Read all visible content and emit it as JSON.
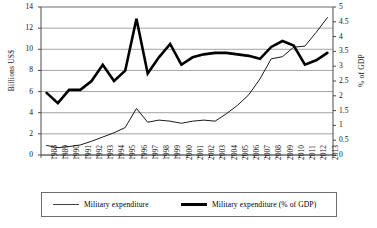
{
  "chart_data": {
    "type": "line",
    "title": "",
    "xlabel": "",
    "ylabel": "Billions US$",
    "y2label": "% of GDP",
    "grid": true,
    "legend_position": "bottom",
    "ylim": [
      0,
      14
    ],
    "y2lim": [
      0,
      5
    ],
    "yticks": [
      "0",
      "2",
      "4",
      "6",
      "8",
      "10",
      "12",
      "14"
    ],
    "ytick_values": [
      0,
      2,
      4,
      6,
      8,
      10,
      12,
      14
    ],
    "y2ticks": [
      "0",
      "0.5",
      "1",
      "1.5",
      "2",
      "2.5",
      "3",
      "3.5",
      "4",
      "4.5",
      "5"
    ],
    "y2tick_values": [
      0,
      0.5,
      1,
      1.5,
      2,
      2.5,
      3,
      3.5,
      4,
      4.5,
      5
    ],
    "categories": [
      "1988",
      "1989",
      "1990",
      "1991",
      "1992",
      "1993",
      "1994",
      "1995",
      "1996",
      "1997",
      "1998",
      "1999",
      "2000",
      "2001",
      "2002",
      "2003",
      "2004",
      "2005",
      "2006",
      "2007",
      "2008",
      "2009",
      "2010",
      "2011",
      "2012",
      "2013"
    ],
    "series": [
      {
        "name": "Military expenditure",
        "axis": "left",
        "unit": "Billions US$",
        "style": "thin",
        "values": [
          0.9,
          0.7,
          0.8,
          0.95,
          1.3,
          1.7,
          2.1,
          2.6,
          4.4,
          3.1,
          3.3,
          3.2,
          3.0,
          3.2,
          3.3,
          3.2,
          3.9,
          4.7,
          5.7,
          7.2,
          9.1,
          9.3,
          10.2,
          10.3,
          11.6,
          13.0
        ]
      },
      {
        "name": "Military expenditure (% of GDP)",
        "axis": "right",
        "unit": "% of GDP",
        "style": "thick",
        "values": [
          2.1,
          1.75,
          2.2,
          2.2,
          2.5,
          3.05,
          2.5,
          2.85,
          4.6,
          2.75,
          3.3,
          3.75,
          3.05,
          3.3,
          3.4,
          3.45,
          3.45,
          3.4,
          3.35,
          3.25,
          3.65,
          3.85,
          3.7,
          3.05,
          3.2,
          3.45
        ]
      }
    ]
  },
  "legend": {
    "entries": [
      {
        "label": "Military expenditure",
        "style": "thin"
      },
      {
        "label": "Military expenditure (% of GDP)",
        "style": "thick"
      }
    ]
  }
}
